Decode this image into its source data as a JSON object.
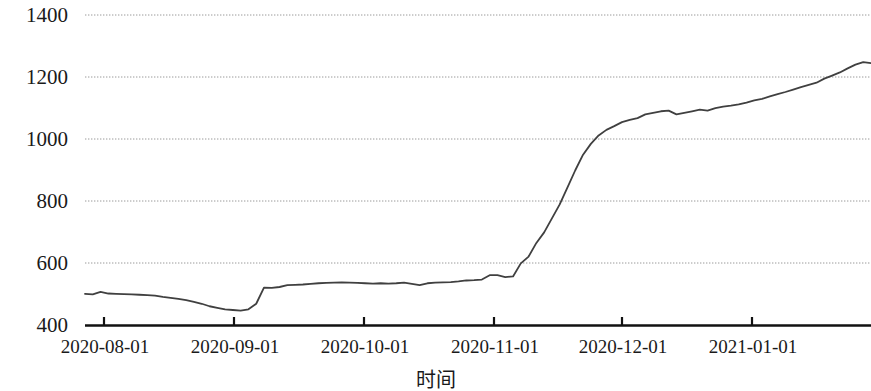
{
  "chart_data": {
    "type": "line",
    "title": "",
    "xlabel": "时间",
    "ylabel": "信用利差（基点）",
    "ylim": [
      400,
      1400
    ],
    "yticks": [
      400,
      600,
      800,
      1000,
      1200,
      1400
    ],
    "ytick_labels": [
      "400",
      "600",
      "800",
      "1000",
      "1200",
      "1400"
    ],
    "xtick_labels": [
      "2020-08-01",
      "2020-09-01",
      "2020-10-01",
      "2020-11-01",
      "2020-12-01",
      "2021-01-01"
    ],
    "xlim": [
      "2020-07-27",
      "2021-01-25"
    ],
    "grid": "horizontal-dotted",
    "legend": "none",
    "line_color": "#404040",
    "series": [
      {
        "name": "信用利差",
        "x": [
          "2020-07-27",
          "2020-07-29",
          "2020-07-31",
          "2020-08-03",
          "2020-08-05",
          "2020-08-07",
          "2020-08-10",
          "2020-08-12",
          "2020-08-14",
          "2020-08-17",
          "2020-08-19",
          "2020-08-21",
          "2020-08-24",
          "2020-08-26",
          "2020-08-28",
          "2020-08-31",
          "2020-09-02",
          "2020-09-04",
          "2020-09-07",
          "2020-09-09",
          "2020-09-11",
          "2020-09-14",
          "2020-09-16",
          "2020-09-18",
          "2020-09-21",
          "2020-09-23",
          "2020-09-25",
          "2020-09-28",
          "2020-09-30",
          "2020-10-05",
          "2020-10-08",
          "2020-10-12",
          "2020-10-14",
          "2020-10-16",
          "2020-10-19",
          "2020-10-21",
          "2020-10-23",
          "2020-10-26",
          "2020-10-28",
          "2020-10-30",
          "2020-11-02",
          "2020-11-04",
          "2020-11-06",
          "2020-11-09",
          "2020-11-11",
          "2020-11-13",
          "2020-11-16",
          "2020-11-18",
          "2020-11-20",
          "2020-11-23",
          "2020-11-25",
          "2020-11-27",
          "2020-11-30",
          "2020-12-02",
          "2020-12-04",
          "2020-12-07",
          "2020-12-09",
          "2020-12-11",
          "2020-12-14",
          "2020-12-16",
          "2020-12-18",
          "2020-12-21",
          "2020-12-23",
          "2020-12-25",
          "2020-12-28",
          "2020-12-30",
          "2021-01-04",
          "2021-01-06",
          "2021-01-08",
          "2021-01-11",
          "2021-01-13",
          "2021-01-15",
          "2021-01-18",
          "2021-01-20",
          "2021-01-22",
          "2021-01-25"
        ],
        "values": [
          502,
          500,
          508,
          503,
          502,
          501,
          500,
          499,
          498,
          496,
          492,
          489,
          486,
          482,
          476,
          470,
          462,
          457,
          452,
          450,
          448,
          452,
          470,
          522,
          521,
          524,
          530,
          531,
          532,
          534,
          536,
          537,
          538,
          539,
          538,
          537,
          536,
          535,
          536,
          535,
          536,
          538,
          534,
          530,
          536,
          538,
          539,
          540,
          542,
          545,
          546,
          548,
          562,
          562,
          556,
          558,
          600,
          622,
          666,
          700,
          745,
          790,
          845,
          900,
          950,
          985,
          1012,
          1030,
          1042,
          1055,
          1062,
          1068,
          1080,
          1085,
          1090,
          1092
        ],
        "values_tail": [
          1080,
          1085,
          1090,
          1095,
          1092,
          1100,
          1105,
          1108,
          1112,
          1118,
          1125,
          1130,
          1138,
          1145,
          1152,
          1160,
          1168,
          1175,
          1182,
          1195,
          1205,
          1215,
          1228,
          1240,
          1248,
          1245
        ]
      }
    ],
    "summary": {
      "start_value": 502,
      "trough_value": 448,
      "end_value": 1245,
      "plateau_value": 537
    }
  },
  "axis": {
    "y_title": "信用利差（基点）",
    "x_title": "时间"
  }
}
